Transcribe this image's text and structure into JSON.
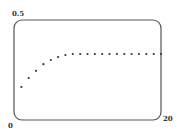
{
  "chart_data": {
    "type": "scatter",
    "title": "",
    "xlabel": "",
    "ylabel": "",
    "xlim": [
      0,
      20
    ],
    "ylim": [
      0,
      0.5
    ],
    "x_tick_labels": [
      "0",
      "20"
    ],
    "y_tick_labels": [
      "0.5"
    ],
    "grid": false,
    "legend": null,
    "series": [
      {
        "name": "series",
        "x": [
          1,
          2,
          3,
          4,
          5,
          6,
          7,
          8,
          9,
          10,
          11,
          12,
          13,
          14,
          15,
          16,
          17,
          18,
          19,
          20
        ],
        "values": [
          0.165,
          0.21,
          0.246,
          0.279,
          0.3,
          0.315,
          0.325,
          0.33,
          0.33,
          0.33,
          0.33,
          0.33,
          0.33,
          0.33,
          0.33,
          0.33,
          0.33,
          0.33,
          0.33,
          0.33
        ]
      }
    ]
  },
  "labels": {
    "y_max": "0.5",
    "x_min": "0",
    "x_max": "20"
  },
  "colors": {
    "frame": "#555555",
    "points": "#333333"
  }
}
